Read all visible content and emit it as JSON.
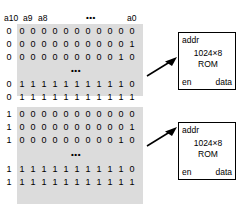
{
  "diagram": {
    "address_table": {
      "headers": [
        "a10",
        "a9",
        "a8",
        "•••",
        "a0"
      ],
      "ellipsis": "•••",
      "blocks": [
        {
          "name": "rom-0-address-block",
          "rows_top": [
            [
              "0",
              "0",
              "0",
              "0",
              "0",
              "0",
              "0",
              "0",
              "0",
              "0",
              "0",
              "0"
            ],
            [
              "0",
              "0",
              "0",
              "0",
              "0",
              "0",
              "0",
              "0",
              "0",
              "0",
              "0",
              "1"
            ],
            [
              "0",
              "0",
              "0",
              "0",
              "0",
              "0",
              "0",
              "0",
              "0",
              "0",
              "1",
              "0"
            ]
          ],
          "rows_bottom": [
            [
              "0",
              "1",
              "1",
              "1",
              "1",
              "1",
              "1",
              "1",
              "1",
              "1",
              "1",
              "0"
            ],
            [
              "0",
              "1",
              "1",
              "1",
              "1",
              "1",
              "1",
              "1",
              "1",
              "1",
              "1",
              "1"
            ]
          ]
        },
        {
          "name": "rom-1-address-block",
          "rows_top": [
            [
              "1",
              "0",
              "0",
              "0",
              "0",
              "0",
              "0",
              "0",
              "0",
              "0",
              "0",
              "0"
            ],
            [
              "1",
              "0",
              "0",
              "0",
              "0",
              "0",
              "0",
              "0",
              "0",
              "0",
              "0",
              "1"
            ],
            [
              "1",
              "0",
              "0",
              "0",
              "0",
              "0",
              "0",
              "0",
              "0",
              "0",
              "1",
              "0"
            ]
          ],
          "rows_bottom": [
            [
              "1",
              "1",
              "1",
              "1",
              "1",
              "1",
              "1",
              "1",
              "1",
              "1",
              "1",
              "0"
            ],
            [
              "1",
              "1",
              "1",
              "1",
              "1",
              "1",
              "1",
              "1",
              "1",
              "1",
              "1",
              "1"
            ]
          ]
        }
      ]
    },
    "rom_devices": [
      {
        "name": "rom-device-1",
        "addr_label": "addr",
        "size_label": "1024×8",
        "type_label": "ROM",
        "en_label": "en",
        "data_label": "data"
      },
      {
        "name": "rom-device-2",
        "addr_label": "addr",
        "size_label": "1024×8",
        "type_label": "ROM",
        "en_label": "en",
        "data_label": "data"
      }
    ],
    "colors": {
      "background": "#ffffff",
      "table_shade": "#dcdcdc",
      "stroke": "#000000",
      "text": "#000000"
    }
  }
}
